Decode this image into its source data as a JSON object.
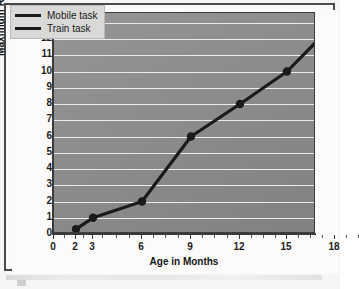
{
  "chart_data": {
    "type": "line",
    "title": "",
    "xlabel": "Age in Months",
    "ylabel": "Maximum Retention in Weeks",
    "xlim": [
      0,
      19.5
    ],
    "ylim": [
      0,
      13.6
    ],
    "grid": true,
    "legend_position": "top-left",
    "x_tick_labels": [
      "0",
      "2",
      "3",
      "6",
      "9",
      "12",
      "15",
      "18"
    ],
    "x_tick_values": [
      0,
      2,
      3,
      6,
      9,
      12,
      15,
      18
    ],
    "y_tick_labels": [
      "0",
      "1",
      "2",
      "3",
      "4",
      "5",
      "6",
      "7",
      "8",
      "9",
      "10",
      "11",
      "12",
      "13"
    ],
    "y_tick_values": [
      0,
      1,
      2,
      3,
      4,
      5,
      6,
      7,
      8,
      9,
      10,
      11,
      12,
      13
    ],
    "series": [
      {
        "name": "Mobile task",
        "color": "#1a1a1a",
        "x": [
          2,
          3,
          6
        ],
        "values": [
          0.3,
          1,
          2
        ]
      },
      {
        "name": "Train task",
        "color": "#1a1a1a",
        "x": [
          6,
          9,
          12,
          15,
          18
        ],
        "values": [
          2,
          6,
          8,
          10,
          13
        ]
      }
    ],
    "points": [
      {
        "x": 2,
        "y": 0.3
      },
      {
        "x": 3,
        "y": 1
      },
      {
        "x": 6,
        "y": 2
      },
      {
        "x": 9,
        "y": 6
      },
      {
        "x": 12,
        "y": 8
      },
      {
        "x": 15,
        "y": 10
      },
      {
        "x": 18,
        "y": 13
      }
    ]
  },
  "legend": {
    "items": [
      {
        "label": "Mobile task",
        "color": "#1a1a1a"
      },
      {
        "label": "Train task",
        "color": "#1a1a1a"
      }
    ]
  },
  "axes": {
    "x_title": "Age in Months",
    "y_title": "Maximum Retention in Weeks"
  },
  "colors": {
    "plot_background": "#8d8d8d",
    "gridline": "#f2f2f2",
    "line": "#1a1a1a",
    "frame": "#4a4a48",
    "page_background": "#fbfaf8"
  }
}
